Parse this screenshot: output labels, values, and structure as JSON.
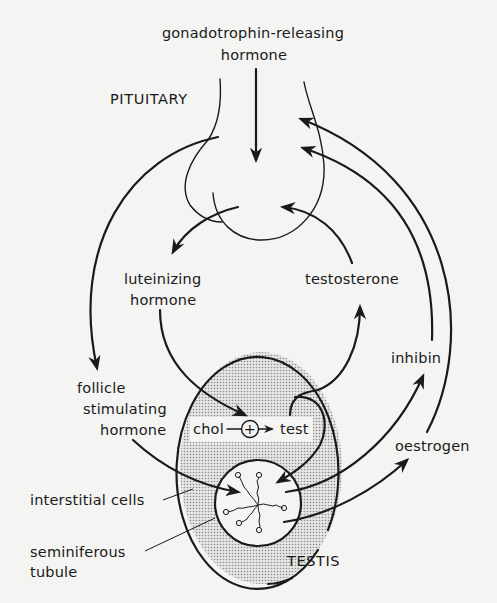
{
  "diagram": {
    "labels": {
      "gnrh_line1": "gonadotrophin-releasing",
      "gnrh_line2": "hormone",
      "pituitary": "PITUITARY",
      "lh_line1": "luteinizing",
      "lh_line2": "hormone",
      "testosterone": "testosterone",
      "fsh_line1": "follicle",
      "fsh_line2": "stimulating",
      "fsh_line3": "hormone",
      "inhibin": "inhibin",
      "oestrogen": "oestrogen",
      "chol": "chol",
      "plus": "+",
      "test": "test",
      "interstitial_cells": "interstitial cells",
      "seminiferous_line1": "seminiferous",
      "seminiferous_line2": "tubule",
      "testis": "TESTIS"
    },
    "nodes": [
      {
        "id": "gnrh",
        "label": "gonadotrophin-releasing hormone"
      },
      {
        "id": "pituitary",
        "label": "PITUITARY"
      },
      {
        "id": "lh",
        "label": "luteinizing hormone"
      },
      {
        "id": "fsh",
        "label": "follicle stimulating hormone"
      },
      {
        "id": "testosterone",
        "label": "testosterone"
      },
      {
        "id": "inhibin",
        "label": "inhibin"
      },
      {
        "id": "oestrogen",
        "label": "oestrogen"
      },
      {
        "id": "testis",
        "label": "TESTIS"
      },
      {
        "id": "interstitial_cells",
        "label": "interstitial cells"
      },
      {
        "id": "seminiferous_tubule",
        "label": "seminiferous tubule"
      }
    ],
    "edges": [
      {
        "from": "gnrh",
        "to": "pituitary"
      },
      {
        "from": "pituitary",
        "to": "lh"
      },
      {
        "from": "pituitary",
        "to": "fsh"
      },
      {
        "from": "lh",
        "to": "interstitial_cells",
        "note": "chol -(+)-> test"
      },
      {
        "from": "fsh",
        "to": "seminiferous_tubule"
      },
      {
        "from": "interstitial_cells",
        "to": "testosterone"
      },
      {
        "from": "interstitial_cells",
        "to": "seminiferous_tubule",
        "note": "test"
      },
      {
        "from": "testosterone",
        "to": "pituitary"
      },
      {
        "from": "seminiferous_tubule",
        "to": "inhibin"
      },
      {
        "from": "inhibin",
        "to": "pituitary"
      },
      {
        "from": "seminiferous_tubule",
        "to": "oestrogen"
      },
      {
        "from": "oestrogen",
        "to": "pituitary"
      }
    ],
    "colors": {
      "ink": "#1a1a1a",
      "background": "#f4f4f2",
      "stipple": "#9a9a9a"
    }
  }
}
